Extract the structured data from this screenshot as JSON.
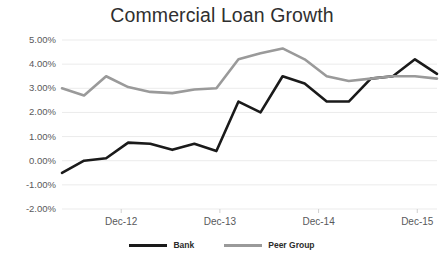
{
  "chart_data": {
    "type": "line",
    "title": "Commercial Loan Growth",
    "xlabel": "",
    "ylabel": "",
    "ylim": [
      -2.0,
      5.0
    ],
    "ytick_values": [
      5.0,
      4.0,
      3.0,
      2.0,
      1.0,
      0.0,
      -1.0,
      -2.0
    ],
    "ytick_labels": [
      "5.00%",
      "4.00%",
      "3.00%",
      "2.00%",
      "1.00%",
      "0.00%",
      "-1.00%",
      "-2.00%"
    ],
    "grid": true,
    "grid_axis": "y",
    "legend_position": "bottom",
    "x_tick_labels": [
      "Dec-12",
      "Dec-13",
      "Dec-14",
      "Dec-15"
    ],
    "x_tick_indices": [
      3,
      8,
      13,
      18
    ],
    "x_count": 20,
    "series": [
      {
        "name": "Bank",
        "color": "#1a1a1a",
        "values": [
          -0.5,
          0.0,
          0.1,
          0.75,
          0.7,
          0.45,
          0.7,
          0.4,
          2.45,
          2.0,
          3.5,
          3.2,
          2.45,
          2.45,
          3.4,
          3.5,
          4.2,
          3.6
        ]
      },
      {
        "name": "Peer Group",
        "color": "#9a9a9a",
        "values": [
          3.0,
          2.7,
          3.5,
          3.05,
          2.85,
          2.8,
          2.95,
          3.0,
          4.2,
          4.45,
          4.65,
          4.2,
          3.5,
          3.3,
          3.4,
          3.5,
          3.5,
          3.4
        ]
      }
    ]
  },
  "legend": {
    "entries": [
      {
        "label": "Bank",
        "swatch": "line-swatch-black"
      },
      {
        "label": "Peer Group",
        "swatch": "line-swatch-gray"
      }
    ]
  },
  "colors": {
    "bank": "#1a1a1a",
    "peer_group": "#9a9a9a",
    "gridline": "#ebebeb",
    "axis_text": "#59595b",
    "title_text": "#2f2f2f",
    "background": "#ffffff"
  }
}
